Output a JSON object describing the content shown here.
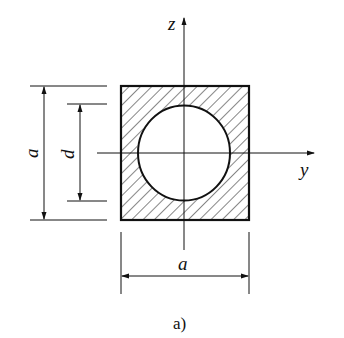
{
  "diagram": {
    "caption": "a)",
    "axes": {
      "horizontal": "y",
      "vertical": "z"
    },
    "dimensions": {
      "outer_height_label": "a",
      "hole_diameter_label": "d",
      "outer_width_label": "a"
    },
    "colors": {
      "stroke": "#111111",
      "background": "#ffffff"
    }
  }
}
